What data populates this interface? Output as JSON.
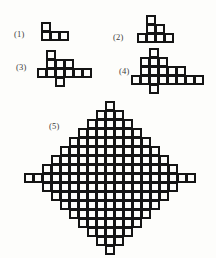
{
  "figure": {
    "background_color": "#fdfdfb",
    "ink_color": "#141414",
    "label_color": "#3a3a3a",
    "cell_pitch": 9,
    "cell_size": 9,
    "stroke_width": 2.2,
    "stages": [
      {
        "label": "(1)",
        "label_x": 14,
        "label_y": 29,
        "origin_x": 41,
        "origin_y": 22,
        "radius": 1,
        "cols": 4,
        "rows": 2,
        "cells": [
          [
            1,
            0,
            0,
            0
          ],
          [
            1,
            1,
            1,
            0
          ]
        ]
      },
      {
        "label": "(2)",
        "label_x": 113,
        "label_y": 32,
        "origin_x": 137,
        "origin_y": 15,
        "radius": 2,
        "cols": 5,
        "rows": 3,
        "cells": [
          [
            0,
            1,
            0,
            0,
            0
          ],
          [
            0,
            1,
            1,
            0,
            0
          ],
          [
            1,
            1,
            1,
            1,
            0
          ]
        ]
      },
      {
        "label": "(3)",
        "label_x": 16,
        "label_y": 62,
        "origin_x": 37,
        "origin_y": 50,
        "radius": 3,
        "cols": 7,
        "rows": 4,
        "cells": [
          [
            0,
            1,
            0,
            0,
            0,
            0,
            0
          ],
          [
            0,
            1,
            1,
            1,
            0,
            0,
            0
          ],
          [
            1,
            1,
            1,
            1,
            1,
            1,
            0
          ],
          [
            0,
            0,
            1,
            0,
            0,
            0,
            0
          ]
        ]
      },
      {
        "label": "(4)",
        "label_x": 119,
        "label_y": 66,
        "origin_x": 131,
        "origin_y": 48,
        "radius": 4,
        "cols": 8,
        "rows": 5,
        "cells": [
          [
            0,
            0,
            1,
            0,
            0,
            0,
            0,
            0
          ],
          [
            0,
            1,
            1,
            1,
            0,
            0,
            0,
            0
          ],
          [
            0,
            1,
            1,
            1,
            1,
            1,
            0,
            0
          ],
          [
            1,
            1,
            1,
            1,
            1,
            1,
            1,
            1
          ],
          [
            0,
            0,
            1,
            0,
            0,
            0,
            0,
            0
          ]
        ]
      },
      {
        "label": "(5)",
        "label_x": 49,
        "label_y": 121,
        "origin_x": 24,
        "origin_y": 101,
        "radius": 9,
        "cols": 19,
        "rows": 17,
        "cells": [
          [
            0,
            0,
            0,
            0,
            0,
            0,
            0,
            0,
            0,
            1,
            0,
            0,
            0,
            0,
            0,
            0,
            0,
            0,
            0
          ],
          [
            0,
            0,
            0,
            0,
            0,
            0,
            0,
            0,
            1,
            1,
            1,
            0,
            0,
            0,
            0,
            0,
            0,
            0,
            0
          ],
          [
            0,
            0,
            0,
            0,
            0,
            0,
            0,
            1,
            1,
            1,
            1,
            1,
            0,
            0,
            0,
            0,
            0,
            0,
            0
          ],
          [
            0,
            0,
            0,
            0,
            0,
            0,
            1,
            1,
            1,
            1,
            1,
            1,
            1,
            0,
            0,
            0,
            0,
            0,
            0
          ],
          [
            0,
            0,
            0,
            0,
            0,
            1,
            1,
            1,
            1,
            1,
            1,
            1,
            1,
            1,
            0,
            0,
            0,
            0,
            0
          ],
          [
            0,
            0,
            0,
            0,
            1,
            1,
            1,
            1,
            1,
            1,
            1,
            1,
            1,
            1,
            1,
            0,
            0,
            0,
            0
          ],
          [
            0,
            0,
            0,
            1,
            1,
            1,
            1,
            1,
            1,
            1,
            1,
            1,
            1,
            1,
            1,
            1,
            0,
            0,
            0
          ],
          [
            0,
            0,
            1,
            1,
            1,
            1,
            1,
            1,
            1,
            1,
            1,
            1,
            1,
            1,
            1,
            1,
            1,
            0,
            0
          ],
          [
            1,
            1,
            1,
            1,
            1,
            1,
            1,
            1,
            1,
            1,
            1,
            1,
            1,
            1,
            1,
            1,
            1,
            1,
            1
          ],
          [
            0,
            0,
            1,
            1,
            1,
            1,
            1,
            1,
            1,
            1,
            1,
            1,
            1,
            1,
            1,
            1,
            1,
            0,
            0
          ],
          [
            0,
            0,
            0,
            1,
            1,
            1,
            1,
            1,
            1,
            1,
            1,
            1,
            1,
            1,
            1,
            1,
            0,
            0,
            0
          ],
          [
            0,
            0,
            0,
            0,
            1,
            1,
            1,
            1,
            1,
            1,
            1,
            1,
            1,
            1,
            1,
            0,
            0,
            0,
            0
          ],
          [
            0,
            0,
            0,
            0,
            0,
            1,
            1,
            1,
            1,
            1,
            1,
            1,
            1,
            1,
            0,
            0,
            0,
            0,
            0
          ],
          [
            0,
            0,
            0,
            0,
            0,
            0,
            1,
            1,
            1,
            1,
            1,
            1,
            1,
            0,
            0,
            0,
            0,
            0,
            0
          ],
          [
            0,
            0,
            0,
            0,
            0,
            0,
            0,
            1,
            1,
            1,
            1,
            1,
            0,
            0,
            0,
            0,
            0,
            0,
            0
          ],
          [
            0,
            0,
            0,
            0,
            0,
            0,
            0,
            0,
            1,
            1,
            1,
            0,
            0,
            0,
            0,
            0,
            0,
            0,
            0
          ],
          [
            0,
            0,
            0,
            0,
            0,
            0,
            0,
            0,
            0,
            1,
            0,
            0,
            0,
            0,
            0,
            0,
            0,
            0,
            0
          ]
        ]
      }
    ]
  }
}
